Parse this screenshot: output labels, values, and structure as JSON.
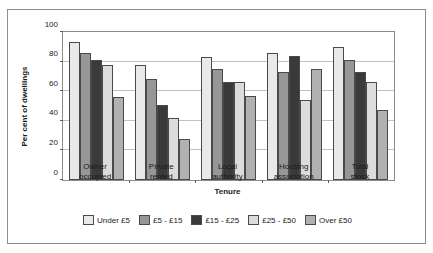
{
  "clipped_caption_text": "",
  "chart_data": {
    "type": "bar",
    "title": "",
    "xlabel": "Tenure",
    "ylabel": "Per cent of dwellings",
    "ylim": [
      0,
      100
    ],
    "yticks": [
      0,
      20,
      40,
      60,
      80,
      100
    ],
    "grid": true,
    "legend_position": "bottom",
    "categories": [
      "Owner occupied",
      "Private rented",
      "Local authority",
      "Housing association",
      "Total stock"
    ],
    "category_lines": [
      [
        "Owner",
        "occupied"
      ],
      [
        "Private",
        "rented"
      ],
      [
        "Local",
        "authority"
      ],
      [
        "Housing",
        "association"
      ],
      [
        "Total",
        "stock"
      ]
    ],
    "series": [
      {
        "name": "Under £5",
        "color": "#e9e9e9",
        "values": [
          93,
          78,
          83,
          86,
          90
        ]
      },
      {
        "name": "£5 - £15",
        "color": "#979797",
        "values": [
          86,
          68,
          75,
          73,
          81
        ]
      },
      {
        "name": "£15 - £25",
        "color": "#3a3a3a",
        "values": [
          81,
          51,
          66,
          84,
          73
        ]
      },
      {
        "name": "£25 - £50",
        "color": "#dcdcdc",
        "values": [
          78,
          42,
          66,
          54,
          66
        ]
      },
      {
        "name": "Over £50",
        "color": "#b1b1b1",
        "values": [
          56,
          28,
          57,
          75,
          47
        ]
      }
    ]
  }
}
